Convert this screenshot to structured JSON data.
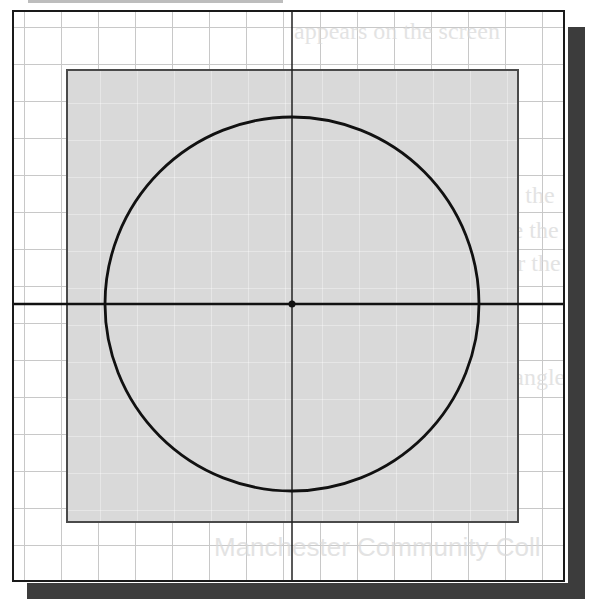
{
  "diagram": {
    "type": "cad-drawing-area",
    "colors": {
      "background": "#ffffff",
      "grid_lines": "#c8c8c8",
      "limits_fill": "#d9d9d9",
      "limits_border": "#4a4a4a",
      "circle_stroke": "#111111",
      "axis_lines": "#111111",
      "shadow": "#3c3c3c"
    },
    "elements": {
      "circle": {
        "label": "circle",
        "center": "origin"
      },
      "center_point": {
        "label": "center point"
      },
      "horizontal_axis": {
        "label": "X axis"
      },
      "vertical_axis": {
        "label": "Y axis"
      },
      "drawing_limits": {
        "label": "drawing limits"
      },
      "grid": {
        "label": "grid"
      }
    },
    "bleed_through_text": [
      "appears on the screen",
      "window appears with the",
      "where and how to use the",
      "the program and enter the",
      "menu to bring up an angle",
      "sketch mode",
      "Manchester Community Coll"
    ]
  }
}
